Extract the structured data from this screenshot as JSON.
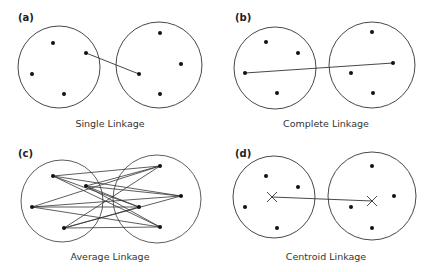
{
  "panels": [
    {
      "id": "a",
      "label": "(a)",
      "caption": "Single Linkage",
      "method": "single"
    },
    {
      "id": "b",
      "label": "(b)",
      "caption": "Complete Linkage",
      "method": "complete"
    },
    {
      "id": "c",
      "label": "(c)",
      "caption": "Average Linkage",
      "method": "average"
    },
    {
      "id": "d",
      "label": "(d)",
      "caption": "Centroid Linkage",
      "method": "centroid"
    }
  ],
  "colors": {
    "stroke": "#333333",
    "point": "#111111",
    "background": "#ffffff"
  }
}
